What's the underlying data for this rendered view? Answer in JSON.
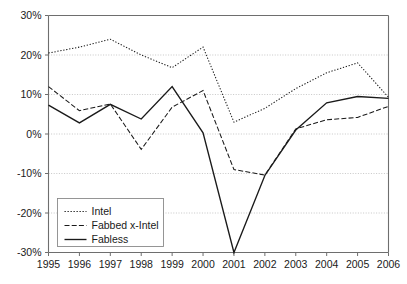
{
  "chart_data": {
    "type": "line",
    "title": "",
    "xlabel": "",
    "ylabel": "",
    "categories": [
      "1995",
      "1996",
      "1997",
      "1998",
      "1999",
      "2000",
      "2001",
      "2002",
      "2003",
      "2004",
      "2005",
      "2006"
    ],
    "x": [
      1995,
      1996,
      1997,
      1998,
      1999,
      2000,
      2001,
      2002,
      2003,
      2004,
      2005,
      2006
    ],
    "ylim": [
      -30,
      30
    ],
    "y_ticks": [
      -30,
      -20,
      -10,
      0,
      10,
      20,
      30
    ],
    "y_tick_labels": [
      "-30%",
      "-20%",
      "-10%",
      "0%",
      "10%",
      "20%",
      "30%"
    ],
    "grid": true,
    "legend_position": "lower-left",
    "series": [
      {
        "name": "Intel",
        "style": "dotted",
        "color": "#1a1a1a",
        "values": [
          20.5,
          22.0,
          24.0,
          20.0,
          16.8,
          22.0,
          3.0,
          6.5,
          11.5,
          15.5,
          18.0,
          9.3
        ]
      },
      {
        "name": "Fabbed x-Intel",
        "style": "dashed",
        "color": "#1a1a1a",
        "values": [
          12.0,
          5.9,
          7.6,
          -3.9,
          6.8,
          11.0,
          -9.0,
          -10.4,
          1.3,
          3.6,
          4.2,
          7.0
        ]
      },
      {
        "name": "Fabless",
        "style": "solid",
        "color": "#1a1a1a",
        "values": [
          7.3,
          2.8,
          7.5,
          3.8,
          12.0,
          0.3,
          -30.0,
          -10.5,
          1.0,
          7.9,
          9.5,
          9.0
        ]
      }
    ]
  },
  "legend": {
    "items": [
      {
        "label": "Intel"
      },
      {
        "label": "Fabbed x-Intel"
      },
      {
        "label": "Fabless"
      }
    ]
  }
}
